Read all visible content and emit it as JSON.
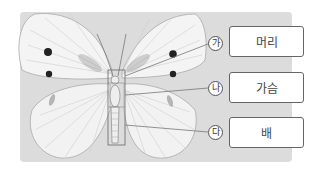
{
  "diagram": {
    "background_color": "#dcdcdc",
    "parts": [
      {
        "marker": "가",
        "label": "머리"
      },
      {
        "marker": "나",
        "label": "가슴"
      },
      {
        "marker": "다",
        "label": "배"
      }
    ]
  }
}
